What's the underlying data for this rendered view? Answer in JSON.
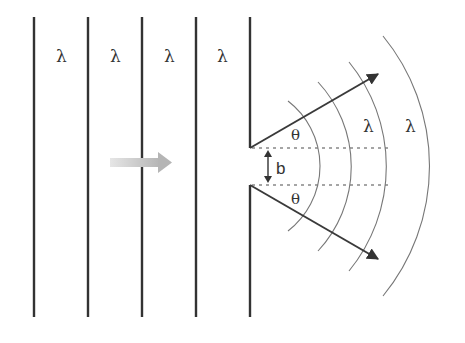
{
  "diagram": {
    "colors": {
      "wavefront": "#333333",
      "arc": "#777777",
      "ray": "#3a3a3a",
      "dashed": "#888888",
      "incident_arrow": "#bdbdbd",
      "label": "#333333"
    },
    "incident_wavefronts": {
      "count": 4,
      "label": "λ",
      "labels": [
        "λ",
        "λ",
        "λ",
        "λ"
      ]
    },
    "barrier": {
      "slit_width_label": "b"
    },
    "angles": {
      "upper_label": "θ",
      "lower_label": "θ"
    },
    "diffracted_wavefronts": {
      "count": 4,
      "labels": [
        "λ",
        "λ"
      ]
    },
    "incident_direction_arrow": "right"
  }
}
